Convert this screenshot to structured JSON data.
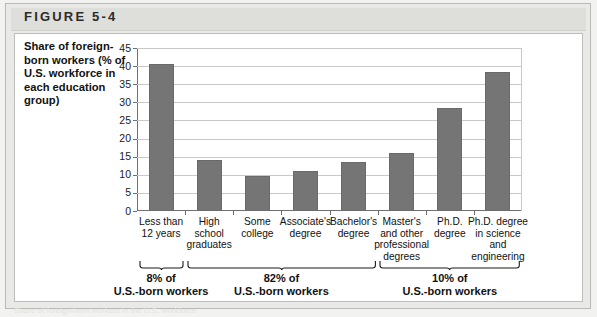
{
  "figure": {
    "label": "FIGURE 5-4",
    "axis_title": "Share of foreign-born workers (% of U.S. workforce in each education group)"
  },
  "chart_data": {
    "type": "bar",
    "title": "Share of foreign-born workers (% of U.S. workforce in each education group)",
    "xlabel": "",
    "ylabel": "Share of foreign-born workers (% of U.S. workforce in each education group)",
    "ylim": [
      0,
      45
    ],
    "ytick_step": 5,
    "yticks": [
      "45",
      "40",
      "35",
      "30",
      "25",
      "20",
      "15",
      "10",
      "5",
      "0"
    ],
    "grid": true,
    "legend": "none",
    "bar_color": "#757575",
    "categories": [
      "Less than 12 years",
      "High school graduates",
      "Some college",
      "Associate's degree",
      "Bachelor's degree",
      "Master's and other professional degrees",
      "Ph.D. degree",
      "Ph.D. degree in science and engineering"
    ],
    "category_lines": [
      [
        "Less than",
        "12 years"
      ],
      [
        "High",
        "school",
        "graduates"
      ],
      [
        "Some",
        "college"
      ],
      [
        "Associate's",
        "degree"
      ],
      [
        "Bachelor's",
        "degree"
      ],
      [
        "Master's",
        "and other",
        "professional",
        "degrees"
      ],
      [
        "Ph.D.",
        "degree"
      ],
      [
        "Ph.D. degree",
        "in science",
        "and",
        "engineering"
      ]
    ],
    "values": [
      40.5,
      14.0,
      9.7,
      11.0,
      13.5,
      16.0,
      28.5,
      38.5
    ],
    "annotations": [
      {
        "pct": "8% of",
        "sub": "U.S.-born workers",
        "covers": [
          0,
          0
        ]
      },
      {
        "pct": "82% of",
        "sub": "U.S.-born workers",
        "covers": [
          1,
          4
        ]
      },
      {
        "pct": "10% of",
        "sub": "U.S.-born workers",
        "covers": [
          5,
          7
        ]
      }
    ]
  },
  "footnote": {
    "text": "Share of foreign-born workers in the U.S. workforce"
  }
}
